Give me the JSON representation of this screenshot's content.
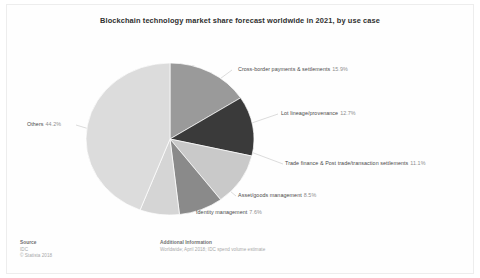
{
  "chart_title": "Blockchain technology market share forecast worldwide in 2021, by use case",
  "chart_data": {
    "type": "pie",
    "title": "Blockchain technology market share forecast worldwide in 2021, by use case",
    "xlabel": "",
    "ylabel": "",
    "value_unit": "percent",
    "legend_position": "callout-labels",
    "grid": false,
    "categories": [
      "Cross-border payments & settlements",
      "Lot lineage/provenance",
      "Trade finance & Post trade/transaction settlements",
      "Asset/goods management",
      "Identity management",
      "Others"
    ],
    "values": [
      15.9,
      12.7,
      11.1,
      8.5,
      7.6,
      44.2
    ],
    "slices": [
      {
        "label": "Cross-border payments & settlements",
        "pct_text": "15.9%",
        "value": 15.9,
        "color": "#9a9a9a"
      },
      {
        "label": "Lot lineage/provenance",
        "pct_text": "12.7%",
        "value": 12.7,
        "color": "#3a3a3a"
      },
      {
        "label": "Trade finance & Post trade/transaction settlements",
        "pct_text": "11.1%",
        "value": 11.1,
        "color": "#c9c9c9"
      },
      {
        "label": "Asset/goods management",
        "pct_text": "8.5%",
        "value": 8.5,
        "color": "#8a8a8a"
      },
      {
        "label": "Identity management",
        "pct_text": "7.6%",
        "value": 7.6,
        "color": "#d5d5d5"
      },
      {
        "label": "Others",
        "pct_text": "44.2%",
        "value": 44.2,
        "color": "#dcdcdc"
      }
    ]
  },
  "footer": {
    "source_heading": "Source",
    "source_line1": "IDC",
    "source_line2": "© Statista 2018",
    "additional_heading": "Additional Information",
    "additional_line1": "Worldwide; April 2018; IDC spend volume estimate"
  }
}
